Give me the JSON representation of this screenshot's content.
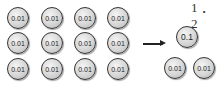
{
  "problem_label": "1．2",
  "left_group": {
    "rows": [
      [
        "0.01",
        "0.01",
        "0.01",
        "0.01"
      ],
      [
        "0.01",
        "0.01",
        "0.01",
        "0.01"
      ],
      [
        "0.01",
        "0.01",
        "0.01",
        "0.01"
      ]
    ]
  },
  "arrow": "right-arrow",
  "right_group": {
    "top": "0.1",
    "bottom": [
      "0.01",
      "0.01"
    ]
  }
}
